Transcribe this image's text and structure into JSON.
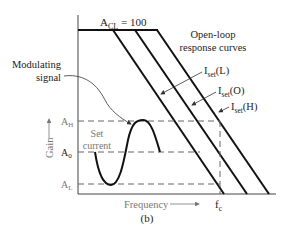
{
  "figure_label": "(b)",
  "acl_label": "A",
  "acl_sub": "CL",
  "acl_value": " = 100",
  "open_loop_line1": "Open-loop",
  "open_loop_line2": "response curves",
  "modulating_line1": "Modulating",
  "modulating_line2": "signal",
  "set_current_line1": "Set",
  "set_current_line2": "current",
  "curves": [
    {
      "name": "I",
      "sub": "set",
      "suffix": "(L)"
    },
    {
      "name": "I",
      "sub": "set",
      "suffix": "(O)"
    },
    {
      "name": "I",
      "sub": "set",
      "suffix": "(H)"
    }
  ],
  "gain_levels": [
    {
      "name": "A",
      "sub": "H"
    },
    {
      "name": "A",
      "sub": "0"
    },
    {
      "name": "A",
      "sub": "L"
    }
  ],
  "y_axis_label": "Gain",
  "x_axis_label": "Frequency",
  "fc_label": "f",
  "fc_sub": "c"
}
